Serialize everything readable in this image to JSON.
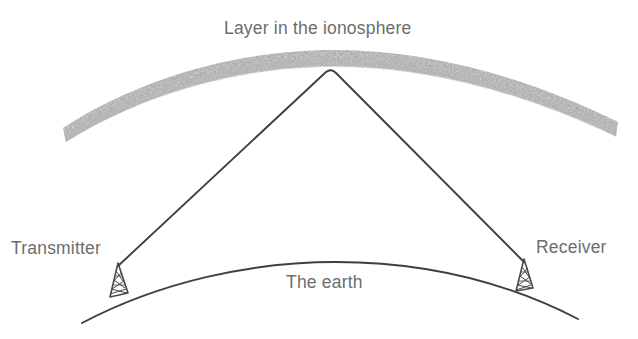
{
  "diagram": {
    "title_label": "Layer in the ionosphere",
    "earth_label": "The earth",
    "transmitter_label": "Transmitter",
    "receiver_label": "Receiver",
    "colors": {
      "background": "#ffffff",
      "text": "#6d6d6d",
      "ray_line": "#3f3f3f",
      "earth_line": "#3f3f3f",
      "ionosphere_band": "#d9d9d9",
      "tower": "#4a4a4a"
    },
    "elements": {
      "ionosphere_band_name": "ionosphere-layer-band",
      "signal_path_name": "radio-signal-path",
      "earth_curve_name": "earth-surface-curve",
      "transmitter_tower_name": "transmitter-antenna-tower",
      "receiver_tower_name": "receiver-antenna-tower"
    }
  }
}
